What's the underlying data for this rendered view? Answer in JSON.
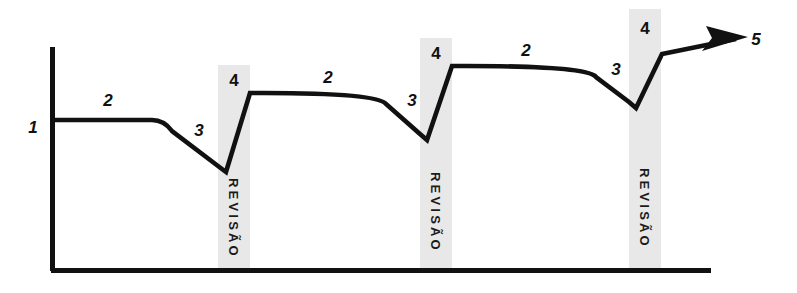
{
  "diagram": {
    "colors": {
      "line": "#111111",
      "axis": "#111111",
      "band_fill": "#e8e8e8",
      "background": "#ffffff",
      "text": "#111111"
    },
    "axes": {
      "y_axis": {
        "x": 51,
        "y_top": 47,
        "y_bottom": 271
      },
      "x_axis": {
        "y": 271,
        "x_left": 51,
        "x_right": 711
      }
    },
    "stage_labels": [
      {
        "id": "label-1",
        "text": "1",
        "x": 33,
        "y": 133
      },
      {
        "id": "label-2-a",
        "text": "2",
        "x": 108,
        "y": 106
      },
      {
        "id": "label-3-a",
        "text": "3",
        "x": 199,
        "y": 136
      },
      {
        "id": "label-2-b",
        "text": "2",
        "x": 328,
        "y": 83
      },
      {
        "id": "label-3-b",
        "text": "3",
        "x": 412,
        "y": 106
      },
      {
        "id": "label-2-c",
        "text": "2",
        "x": 526,
        "y": 56
      },
      {
        "id": "label-3-c",
        "text": "3",
        "x": 616,
        "y": 75
      },
      {
        "id": "label-5",
        "text": "5",
        "x": 756,
        "y": 45
      }
    ],
    "revision_bands": [
      {
        "id": "band-1",
        "number": "4",
        "caption": "REVISÃO",
        "x": 218,
        "width": 32,
        "y_top": 65,
        "y_bottom": 271,
        "number_x": 234,
        "number_y": 86,
        "caption_x": 234,
        "caption_y": 178
      },
      {
        "id": "band-2",
        "number": "4",
        "caption": "REVISÃO",
        "x": 420,
        "width": 32,
        "y_top": 38,
        "y_bottom": 271,
        "number_x": 436,
        "number_y": 59,
        "caption_x": 436,
        "caption_y": 172
      },
      {
        "id": "band-3",
        "number": "4",
        "caption": "REVISÃO",
        "x": 629,
        "width": 32,
        "y_top": 9,
        "y_bottom": 271,
        "number_x": 645,
        "number_y": 34,
        "caption_x": 645,
        "caption_y": 168
      }
    ],
    "curve": {
      "path": "M 51 120 L 152 120 Q 164 120 172 131 L 218 166 L 226 172 L 250 93 L 264 93 Q 378 93 386 104 L 420 134 L 427 140 L 452 66 L 466 66 Q 588 66 596 77 L 629 102 L 636 108 L 662 54 L 736 39",
      "stroke_width": 4.6,
      "description": "Curva de desempenho com quedas antes de cada revisao e recuperacao acima do nivel anterior"
    },
    "arrow": {
      "tip_x": 748,
      "tip_y": 37,
      "points": "748,37 706,26 712,38 702,51"
    },
    "legend_meaning": {
      "1": "Nível inicial",
      "2": "Platô de desempenho",
      "3": "Queda / esquecimento",
      "4": "Revisão",
      "5": "Progresso contínuo"
    }
  }
}
